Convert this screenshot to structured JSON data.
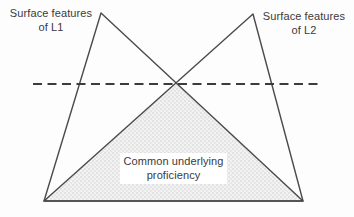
{
  "diagram": {
    "labels": {
      "l1_surface": {
        "line1": "Surface features",
        "line2": "of L1"
      },
      "l2_surface": {
        "line1": "Surface features",
        "line2": "of L2"
      },
      "cup": {
        "line1": "Common underlying",
        "line2": "proficiency"
      }
    },
    "colors": {
      "triangle_outline": "#4b4b4b",
      "dashed_line": "#3c3c3c",
      "text": "#3a3a3a",
      "cup_fill_base": "#f2f2f2",
      "cup_fill_dots": "#c6c6c6",
      "label_box_background": "#ffffff",
      "page_background": "#fdfdfd"
    }
  }
}
